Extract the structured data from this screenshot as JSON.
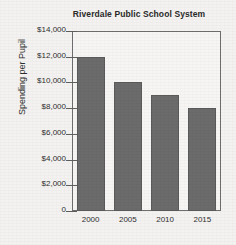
{
  "chart_data": {
    "type": "bar",
    "title": "Riverdale Public School System",
    "xlabel": "",
    "ylabel": "Spending per Pupil",
    "categories": [
      "2000",
      "2005",
      "2010",
      "2015"
    ],
    "values": [
      12000,
      10000,
      9000,
      8000
    ],
    "ylim": [
      0,
      14000
    ],
    "ytick_step": 2000,
    "ytick_labels": [
      "$14,000",
      "$12,000",
      "$10,000",
      "$8,000",
      "$6,000",
      "$4,000",
      "$2,000",
      "0"
    ],
    "ytick_values": [
      14000,
      12000,
      10000,
      8000,
      6000,
      4000,
      2000,
      0
    ],
    "grid": false,
    "legend": false,
    "legend_position": "none",
    "bar_color": "#6b6b6b",
    "axis_color": "#6e6e6e",
    "background_color": "#f3f2f0"
  }
}
